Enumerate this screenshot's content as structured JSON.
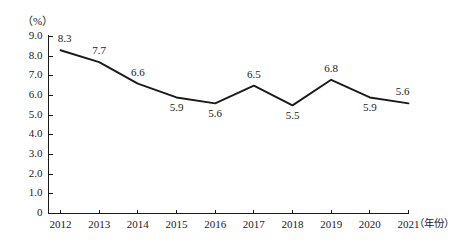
{
  "chart_data": {
    "type": "line",
    "title": "",
    "subtitle": "",
    "xlabel": "（年份）",
    "ylabel": "（%）",
    "categories": [
      "2012",
      "2013",
      "2014",
      "2015",
      "2016",
      "2017",
      "2018",
      "2019",
      "2020",
      "2021"
    ],
    "values": [
      8.3,
      7.7,
      6.6,
      5.9,
      5.6,
      6.5,
      5.5,
      6.8,
      5.9,
      5.6
    ],
    "point_labels": [
      "8.3",
      "7.7",
      "6.6",
      "5.9",
      "5.6",
      "6.5",
      "5.5",
      "6.8",
      "5.9",
      "5.6"
    ],
    "label_placement": [
      "above",
      "above",
      "above",
      "below",
      "below",
      "above",
      "below",
      "above",
      "below",
      "above"
    ],
    "ylim": [
      0,
      9
    ],
    "ytick_labels": [
      "0",
      "1.0",
      "2.0",
      "3.0",
      "4.0",
      "5.0",
      "6.0",
      "7.0",
      "8.0",
      "9.0"
    ],
    "ytick_values": [
      0,
      1,
      2,
      3,
      4,
      5,
      6,
      7,
      8,
      9
    ],
    "grid": false,
    "legend": null,
    "legend_position": "none",
    "series_color": "#1a1a1a",
    "axis_color": "#1a1a1a",
    "background_color": "#ffffff",
    "markers": false
  },
  "icons": {
    "line_series": "line-series-glyph"
  }
}
